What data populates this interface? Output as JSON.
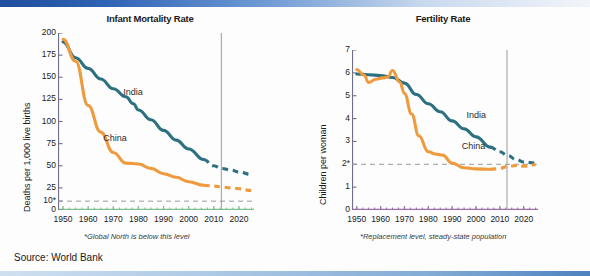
{
  "source_note": "Source: World Bank",
  "charts": [
    {
      "id": "infant-mortality",
      "title": "Infant Mortality Rate",
      "ylabel": "Deaths per 1,000 live births",
      "footnote": "*Global North is below this level",
      "yticks": [
        "0",
        "10*",
        "25",
        "50",
        "75",
        "100",
        "125",
        "150",
        "175",
        "200"
      ],
      "ytick_values": [
        0,
        10,
        25,
        50,
        75,
        100,
        125,
        150,
        175,
        200
      ],
      "xticks": [
        "1950",
        "1960",
        "1970",
        "1980",
        "1990",
        "2000",
        "2010",
        "2020"
      ],
      "xtick_values": [
        1950,
        1960,
        1970,
        1980,
        1990,
        2000,
        2010,
        2020
      ],
      "series_labels": [
        {
          "name": "India",
          "x": 1974,
          "y": 132,
          "color": "#2d7080"
        },
        {
          "name": "China",
          "x": 1966,
          "y": 80,
          "color": "#ef9a3d"
        }
      ],
      "chart_data": {
        "type": "line",
        "title": "Infant Mortality Rate",
        "xlabel": "",
        "ylabel": "Deaths per 1,000 live births",
        "xlim": [
          1948,
          2026
        ],
        "ylim": [
          0,
          200
        ],
        "grid": false,
        "legend": "inline-labels",
        "reference_line": {
          "value": 10,
          "label": "10*",
          "style": "dashed",
          "color": "#9a9a9a"
        },
        "projection_start": 2006,
        "vertical_marker": 2013,
        "series": [
          {
            "name": "India",
            "color": "#2d7080",
            "x": [
              1950,
              1955,
              1960,
              1965,
              1970,
              1975,
              1978,
              1980,
              1985,
              1990,
              1995,
              2000,
              2006,
              2010,
              2013,
              2017,
              2020,
              2025
            ],
            "values": [
              190,
              172,
              160,
              148,
              137,
              128,
              120,
              113,
              102,
              90,
              79,
              69,
              57,
              50,
              47,
              45,
              43,
              40
            ]
          },
          {
            "name": "China",
            "color": "#ef9a3d",
            "x": [
              1950,
              1955,
              1960,
              1965,
              1970,
              1975,
              1980,
              1985,
              1990,
              1995,
              2000,
              2006,
              2010,
              2013,
              2017,
              2020,
              2025
            ],
            "values": [
              193,
              168,
              118,
              88,
              65,
              53,
              52,
              47,
              41,
              37,
              32,
              28,
              27,
              26,
              25,
              24,
              22
            ]
          }
        ]
      }
    },
    {
      "id": "fertility",
      "title": "Fertility Rate",
      "ylabel": "Children per woman",
      "footnote": "*Replacement level, steady-state population",
      "yticks": [
        "0",
        "1",
        "2*",
        "3",
        "4",
        "5",
        "6",
        "7"
      ],
      "ytick_values": [
        0,
        1,
        2,
        3,
        4,
        5,
        6,
        7
      ],
      "xticks": [
        "1950",
        "1960",
        "1970",
        "1980",
        "1990",
        "2000",
        "2010",
        "2020"
      ],
      "xtick_values": [
        1950,
        1960,
        1970,
        1980,
        1990,
        2000,
        2010,
        2020
      ],
      "series_labels": [
        {
          "name": "India",
          "x": 1996,
          "y": 4.1,
          "color": "#2d7080"
        },
        {
          "name": "China",
          "x": 1994,
          "y": 2.75,
          "color": "#ef9a3d"
        }
      ],
      "chart_data": {
        "type": "line",
        "title": "Fertility Rate",
        "xlabel": "",
        "ylabel": "Children per woman",
        "xlim": [
          1948,
          2026
        ],
        "ylim": [
          0,
          7
        ],
        "grid": false,
        "legend": "inline-labels",
        "reference_line": {
          "value": 2,
          "label": "2*",
          "style": "dashed",
          "color": "#9a9a9a"
        },
        "projection_start": 2006,
        "vertical_marker": 2013,
        "series": [
          {
            "name": "India",
            "color": "#2d7080",
            "x": [
              1950,
              1955,
              1960,
              1965,
              1970,
              1975,
              1980,
              1985,
              1990,
              1995,
              2000,
              2006,
              2010,
              2013,
              2017,
              2020,
              2025
            ],
            "values": [
              5.95,
              5.92,
              5.88,
              5.8,
              5.55,
              5.05,
              4.65,
              4.3,
              3.9,
              3.55,
              3.2,
              2.75,
              2.55,
              2.4,
              2.2,
              2.1,
              2.05
            ]
          },
          {
            "name": "China",
            "color": "#ef9a3d",
            "x": [
              1950,
              1953,
              1955,
              1958,
              1961,
              1963,
              1965,
              1968,
              1970,
              1973,
              1976,
              1980,
              1983,
              1986,
              1990,
              1995,
              2000,
              2006,
              2010,
              2013,
              2017,
              2020,
              2025
            ],
            "values": [
              6.15,
              5.9,
              5.58,
              5.72,
              5.78,
              5.82,
              6.1,
              5.6,
              5.1,
              4.2,
              3.25,
              2.55,
              2.45,
              2.4,
              2.05,
              1.85,
              1.8,
              1.78,
              1.82,
              1.9,
              1.95,
              1.92,
              1.98
            ]
          }
        ]
      }
    }
  ]
}
